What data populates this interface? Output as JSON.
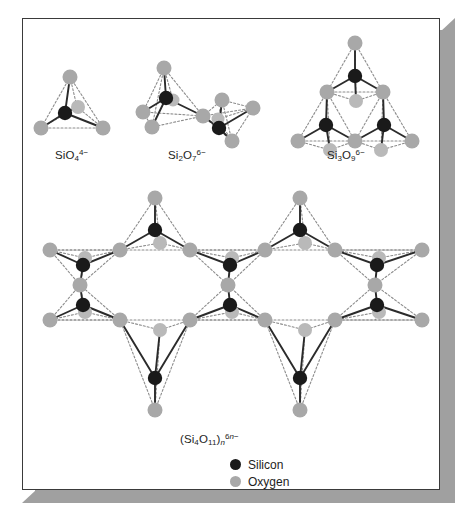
{
  "figure": {
    "background": "#ffffff",
    "frame": {
      "border_color": "#3a3a3a",
      "shadow_color": "#a0a0a0"
    },
    "colors": {
      "silicon": "#1a1a1a",
      "oxygen": "#a8a8a8",
      "bond": "#2b2b2b",
      "dotted": "#8c8c8c"
    }
  },
  "structures": [
    {
      "id": "orthosilicate",
      "label_html": "SiO<sub>4</sub><sup>4&#8722;</sup>",
      "label_plain": "SiO4 4-",
      "description": "single tetrahedron",
      "si_count": 1,
      "o_count": 4
    },
    {
      "id": "pyrosilicate",
      "label_html": "Si<sub>2</sub>O<sub>7</sub><sup>6&#8722;</sup>",
      "label_plain": "Si2O7 6-",
      "description": "two corner-sharing tetrahedra",
      "si_count": 2,
      "o_count": 7
    },
    {
      "id": "cyclosilicate",
      "label_html": "Si<sub>3</sub>O<sub>9</sub><sup>6&#8722;</sup>",
      "label_plain": "Si3O9 6-",
      "description": "three-membered ring",
      "si_count": 3,
      "o_count": 9
    },
    {
      "id": "double-chain",
      "label_html": "(Si<sub>4</sub>O<sub>11</sub>)<sub><i>n</i></sub><sup>6<i>n</i>&#8722;</sup>",
      "label_plain": "(Si4O11)n 6n-",
      "description": "amphibole double chain",
      "si_count": 8,
      "o_count": 22
    }
  ],
  "legend": {
    "items": [
      {
        "name": "silicon",
        "label": "Silicon",
        "color": "#1a1a1a"
      },
      {
        "name": "oxygen",
        "label": "Oxygen",
        "color": "#a8a8a8"
      }
    ]
  }
}
